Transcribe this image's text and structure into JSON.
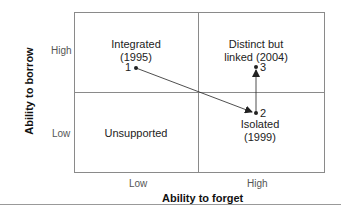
{
  "diagram": {
    "type": "2x2 matrix",
    "y_axis": {
      "title": "Ability to borrow",
      "ticks": [
        "High",
        "Low"
      ]
    },
    "x_axis": {
      "title": "Ability to forget",
      "ticks": [
        "Low",
        "High"
      ]
    },
    "quadrants": {
      "top_left": {
        "line1": "Integrated",
        "line2": "(1995)"
      },
      "top_right": {
        "line1": "Distinct but",
        "line2": "linked (2004)"
      },
      "bottom_left": {
        "line1": "Unsupported"
      },
      "bottom_right": {
        "line1": "Isolated",
        "line2": "(1999)"
      }
    },
    "points": [
      {
        "label": "1",
        "quadrant": "Integrated",
        "year": "1995"
      },
      {
        "label": "2",
        "quadrant": "Isolated",
        "year": "1999"
      },
      {
        "label": "3",
        "quadrant": "Distinct but linked",
        "year": "2004"
      }
    ],
    "arrows": [
      {
        "from": "1",
        "to": "2"
      },
      {
        "from": "2",
        "to": "3"
      }
    ],
    "colors": {
      "border": "#8a8a8a",
      "text": "#222222",
      "arrow": "#222222"
    }
  }
}
